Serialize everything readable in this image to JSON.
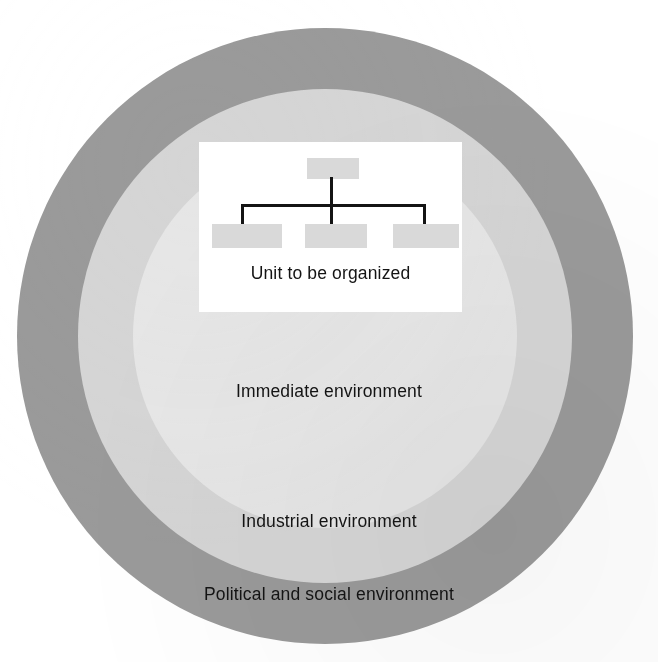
{
  "figure": {
    "top_caption": "",
    "alt_title": "Concentric environment circles surrounding the unit to be organized"
  },
  "rings": [
    {
      "id": "inner",
      "label": "Immediate environment",
      "color": "#e6e6e6"
    },
    {
      "id": "middle",
      "label": "Industrial environment",
      "color": "#d5d5d5"
    },
    {
      "id": "outer",
      "label": "Political and social environment",
      "color": "#9a9a9a"
    }
  ],
  "unit_card": {
    "caption": "Unit to be organized",
    "background": "#ffffff",
    "box_color": "#d9d9d9",
    "line_color": "#141414",
    "boxes": [
      {
        "id": "top",
        "label": ""
      },
      {
        "id": "left",
        "label": ""
      },
      {
        "id": "center",
        "label": ""
      },
      {
        "id": "right",
        "label": ""
      }
    ]
  },
  "chart_data": {
    "type": "diagram",
    "structure": "concentric-circles",
    "layers": [
      {
        "order": 1,
        "name": "Unit to be organized",
        "shape": "rectangle",
        "fill": "#ffffff"
      },
      {
        "order": 2,
        "name": "Immediate environment",
        "shape": "circle",
        "fill": "#e6e6e6"
      },
      {
        "order": 3,
        "name": "Industrial environment",
        "shape": "circle",
        "fill": "#d5d5d5"
      },
      {
        "order": 4,
        "name": "Political and social environment",
        "shape": "circle",
        "fill": "#9a9a9a"
      }
    ],
    "inset_chart": {
      "type": "org-chart",
      "levels": 2,
      "nodes_level_1": 1,
      "nodes_level_2": 3,
      "node_labels": [
        "",
        "",
        "",
        ""
      ]
    }
  }
}
